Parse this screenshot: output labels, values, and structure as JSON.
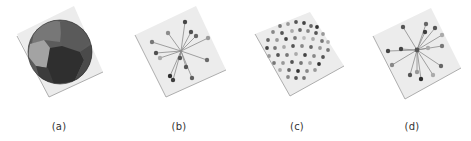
{
  "figure": {
    "panels": [
      {
        "id": "a",
        "label": "(a)",
        "kind": "segmented-sphere"
      },
      {
        "id": "b",
        "label": "(b)",
        "kind": "star-graph"
      },
      {
        "id": "c",
        "label": "(c)",
        "kind": "point-cloud-sphere"
      },
      {
        "id": "d",
        "label": "(d)",
        "kind": "star-graph"
      }
    ]
  },
  "colors": {
    "plane_fill": "#ececec",
    "plane_edge": "#9a9a9a",
    "sphere_dark": "#3a3a3a",
    "sphere_mid": "#6e6e6e",
    "sphere_light": "#a8a8a8",
    "edge_line": "#888888",
    "node_dark": "#444444"
  }
}
